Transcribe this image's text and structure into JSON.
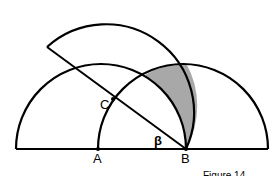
{
  "diagram": {
    "points": [
      {
        "id": "A",
        "label": "A",
        "x": 98,
        "y": 149
      },
      {
        "id": "B",
        "label": "B",
        "x": 186,
        "y": 149
      },
      {
        "id": "C",
        "label": "C",
        "x": 113,
        "y": 100
      }
    ],
    "angle_label": "β",
    "caption": "Figure 14",
    "colors": {
      "stroke": "#000000",
      "shade": "#a8a8a8",
      "background": "#ffffff"
    }
  }
}
